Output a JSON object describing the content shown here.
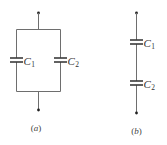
{
  "figure": {
    "circuit_a": {
      "caption": "(a)",
      "configuration": "parallel",
      "capacitors": [
        {
          "name": "C",
          "subscript": "1"
        },
        {
          "name": "C",
          "subscript": "2"
        }
      ]
    },
    "circuit_b": {
      "caption": "(b)",
      "configuration": "series",
      "capacitors": [
        {
          "name": "C",
          "subscript": "1"
        },
        {
          "name": "C",
          "subscript": "2"
        }
      ]
    },
    "colors": {
      "wire": "#6e6e6e",
      "plate": "#3a3a3a",
      "node": "#222222",
      "text": "#333333"
    }
  }
}
